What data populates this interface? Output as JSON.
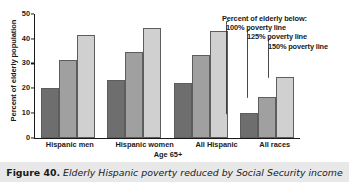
{
  "figure": {
    "label": "Figure 40.",
    "caption": "Elderly Hispanic poverty reduced by Social Security income"
  },
  "legend": {
    "title": "Percent of elderly below:",
    "items": [
      {
        "label": "100% poverty line",
        "color": "#6e6e6e"
      },
      {
        "label": "125% poverty line",
        "color": "#a0a0a0"
      },
      {
        "label": "150% poverty line",
        "color": "#d0d0d0"
      }
    ]
  },
  "chart_data": {
    "type": "bar",
    "title": "",
    "xlabel": "Age 65+",
    "ylabel": "Percent of elderly population",
    "categories": [
      "Hispanic men",
      "Hispanic women",
      "All Hispanic",
      "All races"
    ],
    "series": [
      {
        "name": "100% poverty line",
        "color": "#6e6e6e",
        "values": [
          20.0,
          23.5,
          22.0,
          10.0
        ]
      },
      {
        "name": "125% poverty line",
        "color": "#a0a0a0",
        "values": [
          31.5,
          34.5,
          33.3,
          16.5
        ]
      },
      {
        "name": "150% poverty line",
        "color": "#d0d0d0",
        "values": [
          41.5,
          44.5,
          43.3,
          24.5
        ]
      }
    ],
    "ylim": [
      0,
      50
    ],
    "yticks": [
      0,
      10,
      20,
      30,
      40,
      50
    ],
    "ytick_labels": [
      "0",
      "10",
      "20",
      "30",
      "40",
      "50"
    ],
    "grid": false,
    "legend_position": "top-right"
  }
}
